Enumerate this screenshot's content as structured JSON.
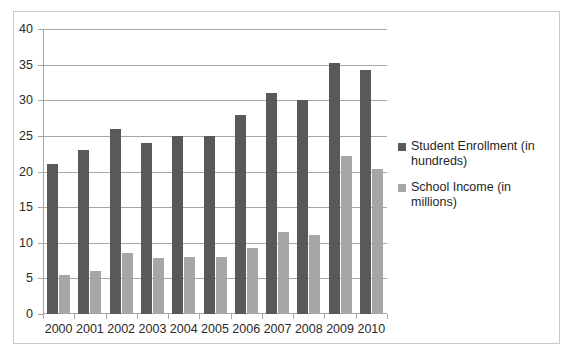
{
  "chart_data": {
    "type": "bar",
    "title": "",
    "xlabel": "",
    "ylabel": "",
    "ylim": [
      0,
      40
    ],
    "yticks": [
      0,
      5,
      10,
      15,
      20,
      25,
      30,
      35,
      40
    ],
    "grid": true,
    "legend_position": "right",
    "categories": [
      "2000",
      "2001",
      "2002",
      "2003",
      "2004",
      "2005",
      "2006",
      "2007",
      "2008",
      "2009",
      "2010"
    ],
    "series": [
      {
        "name": "Student Enrollment (in hundreds)",
        "color": "#595959",
        "values": [
          21,
          23,
          26,
          24,
          25,
          25,
          28,
          31,
          30,
          35.2,
          34.2
        ]
      },
      {
        "name": "School Income (in millions)",
        "color": "#a6a6a6",
        "values": [
          5.5,
          6,
          8.5,
          7.8,
          8,
          8,
          9.2,
          11.5,
          11.1,
          22.2,
          20.4
        ]
      }
    ]
  },
  "colors": {
    "enrollment": "#595959",
    "income": "#a6a6a6",
    "gridline": "#a6a6a6",
    "frame": "#c9c9c9",
    "text": "#2a2a2a"
  }
}
